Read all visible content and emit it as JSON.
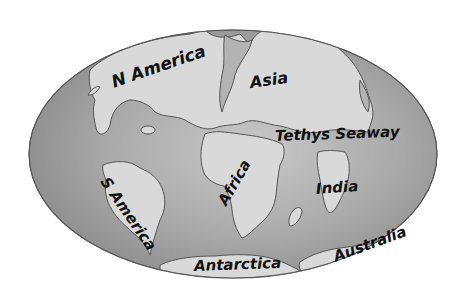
{
  "map": {
    "title": "",
    "projection": "oval world map",
    "colors": {
      "background": "#ffffff",
      "ocean": "#a8a8a8",
      "ocean_edge": "#7a7a7a",
      "land": "#d9d9d9",
      "coast": "#555555",
      "label": "#111111"
    },
    "labels": [
      {
        "id": "n-america",
        "text": "N America"
      },
      {
        "id": "asia",
        "text": "Asia"
      },
      {
        "id": "tethys-seaway",
        "text": "Tethys Seaway"
      },
      {
        "id": "s-america",
        "text": "S America"
      },
      {
        "id": "africa",
        "text": "Africa"
      },
      {
        "id": "india",
        "text": "India"
      },
      {
        "id": "antarctica",
        "text": "Antarctica"
      },
      {
        "id": "australia",
        "text": "Australia"
      }
    ]
  }
}
